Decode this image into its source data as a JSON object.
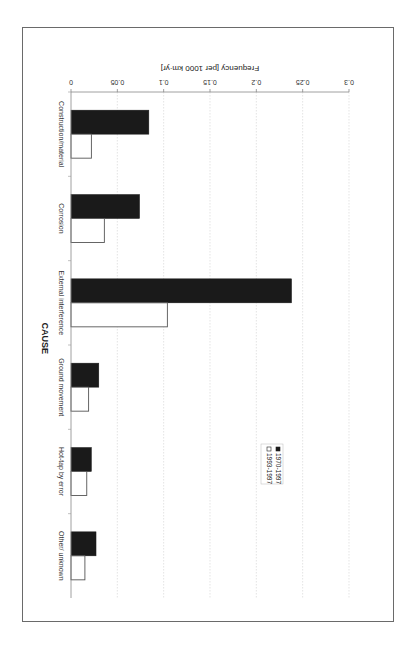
{
  "chart_data": {
    "type": "bar",
    "orientation": "rotated-90-clockwise",
    "title": "",
    "xlabel": "CAUSE",
    "ylabel": "Frequency [per 1000 km·yr]",
    "ylim": [
      0,
      0.3
    ],
    "yticks": [
      0,
      0.05,
      0.1,
      0.15,
      0.2,
      0.25,
      0.3
    ],
    "ytick_labels": [
      "0",
      "0.05",
      "0.1",
      "0.15",
      "0.2",
      "0.25",
      "0.3"
    ],
    "grid": true,
    "legend_position": "center",
    "categories": [
      "Construction/material",
      "Corrosion",
      "External interference",
      "Ground movement",
      "Hot-tap by error",
      "Other/ unknown"
    ],
    "series": [
      {
        "name": "1970-1997",
        "color": "#1a1a1a",
        "values": [
          0.084,
          0.074,
          0.238,
          0.03,
          0.022,
          0.027
        ]
      },
      {
        "name": "1993-1997",
        "color": "#ffffff",
        "values": [
          0.022,
          0.036,
          0.104,
          0.019,
          0.017,
          0.015
        ]
      }
    ]
  }
}
